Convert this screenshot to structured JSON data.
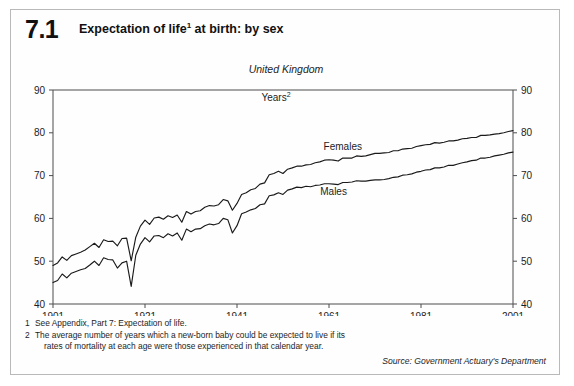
{
  "figure": {
    "number": "7.1",
    "title": "Expectation of life",
    "title_sup": "1",
    "title_tail": " at birth: by sex",
    "region": "United Kingdom",
    "units": "Years",
    "units_sup": "2",
    "source": "Source: Government Actuary's Department"
  },
  "footnotes": [
    {
      "num": "1",
      "text": "See Appendix, Part 7: Expectation of life."
    },
    {
      "num": "2",
      "text": "The average number of years which a new-born baby could be expected to live if its",
      "text2": "rates of mortality at each age were those experienced in that calendar year."
    }
  ],
  "chart_data": {
    "type": "line",
    "subtitle": "United Kingdom",
    "xlabel": "",
    "ylabel": "Years",
    "xlim": [
      1901,
      2001
    ],
    "ylim": [
      40,
      90
    ],
    "ytick_step": 10,
    "yticks": [
      40,
      50,
      60,
      70,
      80,
      90
    ],
    "xticks": [
      1901,
      1921,
      1941,
      1961,
      1981,
      2001
    ],
    "grid": false,
    "legend": "inline-labels",
    "axis_style": "mirrored-left-right",
    "annotations": [
      {
        "label": "Females",
        "x": 1964,
        "y": 76.0
      },
      {
        "label": "Males",
        "x": 1962,
        "y": 65.5
      }
    ],
    "x": [
      1901,
      1902,
      1903,
      1904,
      1905,
      1906,
      1907,
      1908,
      1909,
      1910,
      1911,
      1912,
      1913,
      1914,
      1915,
      1916,
      1917,
      1918,
      1919,
      1920,
      1921,
      1922,
      1923,
      1924,
      1925,
      1926,
      1927,
      1928,
      1929,
      1930,
      1931,
      1932,
      1933,
      1934,
      1935,
      1936,
      1937,
      1938,
      1939,
      1940,
      1941,
      1942,
      1943,
      1944,
      1945,
      1946,
      1947,
      1948,
      1949,
      1950,
      1951,
      1952,
      1953,
      1954,
      1955,
      1956,
      1957,
      1958,
      1959,
      1960,
      1961,
      1962,
      1963,
      1964,
      1965,
      1966,
      1967,
      1968,
      1969,
      1970,
      1971,
      1972,
      1973,
      1974,
      1975,
      1976,
      1977,
      1978,
      1979,
      1980,
      1981,
      1982,
      1983,
      1984,
      1985,
      1986,
      1987,
      1988,
      1989,
      1990,
      1991,
      1992,
      1993,
      1994,
      1995,
      1996,
      1997,
      1998,
      1999,
      2000,
      2001
    ],
    "series": [
      {
        "name": "Females",
        "values": [
          49.0,
          49.6,
          51.0,
          50.2,
          51.3,
          51.7,
          52.1,
          52.6,
          53.4,
          54.2,
          53.2,
          55.0,
          54.6,
          54.7,
          53.6,
          55.3,
          55.4,
          50.1,
          55.6,
          58.2,
          59.6,
          58.6,
          60.1,
          60.3,
          59.8,
          60.6,
          60.2,
          60.8,
          59.1,
          61.6,
          61.0,
          61.6,
          61.8,
          62.6,
          63.0,
          62.9,
          63.2,
          64.4,
          64.1,
          61.9,
          63.5,
          65.6,
          66.0,
          66.7,
          67.0,
          68.0,
          68.3,
          70.2,
          70.5,
          71.0,
          70.5,
          71.5,
          71.8,
          72.2,
          72.2,
          72.5,
          72.6,
          73.0,
          73.2,
          73.6,
          73.7,
          73.6,
          73.4,
          74.1,
          74.1,
          74.1,
          74.6,
          74.5,
          74.6,
          74.9,
          75.2,
          75.2,
          75.3,
          75.4,
          75.8,
          75.8,
          76.2,
          76.3,
          76.4,
          76.8,
          77.0,
          77.2,
          77.3,
          77.7,
          77.6,
          77.8,
          78.1,
          78.1,
          78.3,
          78.6,
          78.7,
          78.9,
          78.9,
          79.4,
          79.4,
          79.5,
          79.7,
          79.8,
          80.0,
          80.3,
          80.5
        ]
      },
      {
        "name": "Males",
        "values": [
          45.0,
          45.5,
          47.0,
          46.1,
          47.2,
          47.6,
          48.0,
          48.3,
          49.1,
          50.0,
          49.0,
          50.8,
          50.4,
          50.3,
          48.4,
          49.6,
          50.0,
          44.1,
          51.4,
          54.0,
          55.5,
          54.5,
          55.9,
          56.0,
          55.5,
          56.4,
          55.9,
          56.6,
          54.9,
          57.5,
          56.9,
          57.5,
          57.6,
          58.3,
          58.7,
          58.5,
          58.8,
          60.0,
          59.7,
          56.6,
          58.3,
          61.1,
          61.5,
          62.0,
          62.3,
          63.2,
          63.4,
          65.3,
          65.5,
          66.0,
          65.6,
          66.6,
          66.9,
          67.3,
          67.2,
          67.5,
          67.4,
          67.7,
          67.8,
          68.1,
          68.1,
          68.0,
          67.9,
          68.4,
          68.4,
          68.5,
          68.8,
          68.7,
          68.7,
          68.9,
          69.0,
          69.0,
          69.1,
          69.3,
          69.6,
          69.7,
          70.1,
          70.2,
          70.4,
          70.8,
          71.0,
          71.3,
          71.4,
          71.8,
          71.8,
          72.0,
          72.4,
          72.4,
          72.7,
          73.0,
          73.2,
          73.5,
          73.6,
          74.1,
          74.1,
          74.3,
          74.6,
          74.8,
          75.0,
          75.3,
          75.5
        ]
      }
    ]
  }
}
